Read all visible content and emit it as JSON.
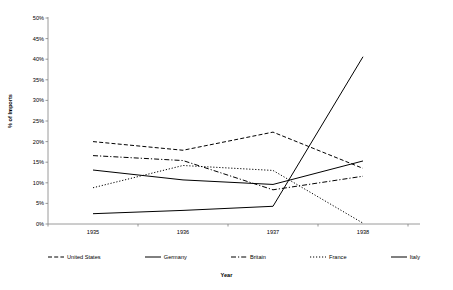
{
  "chart_data": {
    "type": "line",
    "title": "",
    "xlabel": "Year",
    "ylabel": "% of Imports",
    "categories": [
      "1935",
      "1936",
      "1937",
      "1938"
    ],
    "x": [
      1935,
      1936,
      1937,
      1938
    ],
    "ylim": [
      0,
      50
    ],
    "ytick_labels": [
      "0%",
      "5%",
      "10%",
      "15%",
      "20%",
      "25%",
      "30%",
      "35%",
      "40%",
      "45%",
      "50%"
    ],
    "ytick_values": [
      0,
      5,
      10,
      15,
      20,
      25,
      30,
      35,
      40,
      45,
      50
    ],
    "grid": false,
    "legend_position": "bottom",
    "series": [
      {
        "name": "United States",
        "style": "dashed",
        "color": "#000000",
        "values": [
          20.0,
          17.9,
          22.3,
          13.5
        ]
      },
      {
        "name": "Germany",
        "style": "solid",
        "color": "#000000",
        "values": [
          2.5,
          3.3,
          4.3,
          40.6
        ]
      },
      {
        "name": "Britain",
        "style": "dash-dot",
        "color": "#000000",
        "values": [
          16.6,
          15.4,
          8.3,
          11.6
        ]
      },
      {
        "name": "France",
        "style": "dotted",
        "color": "#000000",
        "values": [
          8.8,
          14.2,
          13.0,
          0.2
        ]
      },
      {
        "name": "Italy",
        "style": "solid",
        "color": "#000000",
        "values": [
          13.1,
          10.7,
          9.6,
          15.3
        ]
      }
    ]
  },
  "axes": {
    "y_title": "% of Imports",
    "x_title": "Year"
  },
  "legend": {
    "entries": [
      {
        "label": "United States",
        "style": "dashed"
      },
      {
        "label": "Germany",
        "style": "solid"
      },
      {
        "label": "Britain",
        "style": "dash-dot"
      },
      {
        "label": "France",
        "style": "dotted"
      },
      {
        "label": "Italy",
        "style": "solid"
      }
    ]
  },
  "colors": {
    "axis": "#808080",
    "line": "#000000",
    "background": "#ffffff"
  }
}
